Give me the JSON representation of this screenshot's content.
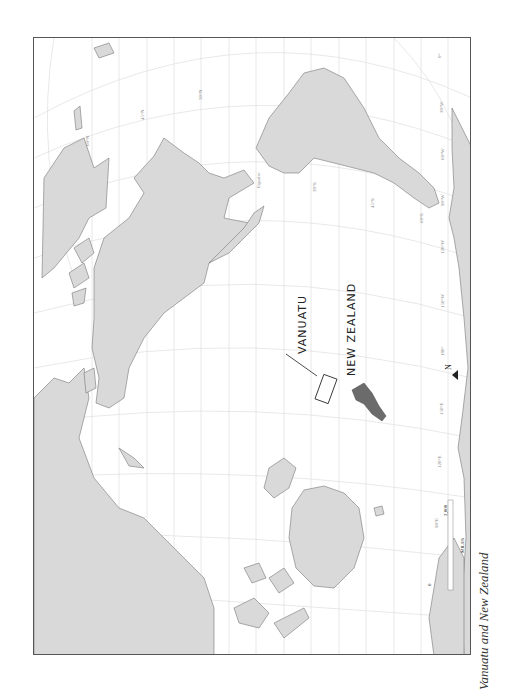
{
  "caption": "Vanuatu and New Zealand",
  "labels": {
    "vanuatu": "VANUATU",
    "new_zealand": "NEW ZEALAND"
  },
  "scale": {
    "start": "0",
    "unit": "MILES",
    "end": "2,000"
  },
  "north_arrow": "N",
  "grid_labels": {
    "lat_60n": "60°N",
    "lat_45n": "45°N",
    "lat_30n": "30°N",
    "equator": "Equator",
    "lat_30s": "30°S",
    "lat_45s": "45°S",
    "lat_60s": "60°S",
    "lon_0": "0°",
    "lon_30w": "30°W",
    "lon_60w": "60°W",
    "lon_90w": "90°W",
    "lon_120w": "120°W",
    "lon_150w": "150°W",
    "lon_180": "180°",
    "lon_150e": "150°E",
    "lon_120e": "120°E",
    "lon_90e": "90°E"
  },
  "colors": {
    "land": "#d9d9d9",
    "land_stroke": "#777777",
    "highlight_land": "#6b6b6b",
    "grid": "#e4e4e4",
    "frame": "#555555"
  }
}
